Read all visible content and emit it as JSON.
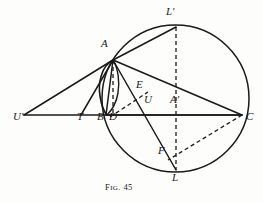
{
  "figure": {
    "caption_prefix": "F",
    "caption_smallcaps": "IG",
    "caption_suffix": ". 45",
    "caption_full": "Fig. 45",
    "ink_color": "#1a1a1a",
    "paper_color": "#fdfdfb",
    "width": 263,
    "height": 202
  },
  "points": [
    {
      "key": "Uprime",
      "label": "U'",
      "x": 24,
      "y": 115,
      "label_x": 13,
      "label_y": 117
    },
    {
      "key": "T",
      "label": "T",
      "x": 81,
      "y": 115,
      "label_x": 77,
      "label_y": 117
    },
    {
      "key": "B",
      "label": "B",
      "x": 106,
      "y": 115,
      "label_x": 99,
      "label_y": 117
    },
    {
      "key": "D",
      "label": "D",
      "x": 113,
      "y": 115,
      "label_x": 110,
      "label_y": 117
    },
    {
      "key": "A",
      "label": "A",
      "x": 113,
      "y": 60,
      "label_x": 102,
      "label_y": 44
    },
    {
      "key": "E",
      "label": "E",
      "x": 144,
      "y": 96,
      "label_x": 137,
      "label_y": 85
    },
    {
      "key": "U",
      "label": "U",
      "x": 150,
      "y": 115,
      "label_x": 145,
      "label_y": 100
    },
    {
      "key": "Aprime",
      "label": "A'",
      "x": 176,
      "y": 115,
      "label_x": 172,
      "label_y": 100
    },
    {
      "key": "C",
      "label": "C",
      "x": 242,
      "y": 115,
      "label_x": 247,
      "label_y": 117
    },
    {
      "key": "Lprime",
      "label": "L'",
      "x": 176,
      "y": 27,
      "label_x": 167,
      "label_y": 12
    },
    {
      "key": "F",
      "label": "F",
      "x": 168,
      "y": 158,
      "label_x": 160,
      "label_y": 151
    },
    {
      "key": "L",
      "label": "L",
      "x": 176,
      "y": 170,
      "label_x": 172,
      "label_y": 175
    }
  ],
  "circles": [
    {
      "key": "main-circle",
      "cx": 175.5,
      "cy": 98.5,
      "r": 73.5,
      "style": "solid"
    },
    {
      "key": "small-circle",
      "cx": 106.5,
      "cy": 88.0,
      "r": 28.0,
      "style": "solid"
    }
  ],
  "solid_segments": [
    {
      "key": "line-Uprime-C",
      "from": "Uprime",
      "to": "C"
    },
    {
      "key": "line-Uprime-A",
      "from": "Uprime",
      "to": "A"
    },
    {
      "key": "line-T-A",
      "from": "T",
      "to": "A"
    },
    {
      "key": "line-A-Lprime",
      "from": "A",
      "to": "Lprime"
    },
    {
      "key": "line-A-C",
      "from": "A",
      "to": "C"
    },
    {
      "key": "line-A-B",
      "from": "A",
      "to": "B"
    },
    {
      "key": "line-A-L",
      "from": "A",
      "to": "L"
    },
    {
      "key": "line-B-C-chord",
      "from": "B",
      "to": "C"
    }
  ],
  "dashed_segments": [
    {
      "key": "line-A-D-dashed",
      "from": "A",
      "to": "D"
    },
    {
      "key": "line-D-E-dashed",
      "from": "D",
      "to": "E"
    },
    {
      "key": "line-Lprime-L-dashed",
      "from": "Lprime",
      "to": "L"
    },
    {
      "key": "line-C-F-dashed",
      "from": "C",
      "to": "F"
    }
  ]
}
